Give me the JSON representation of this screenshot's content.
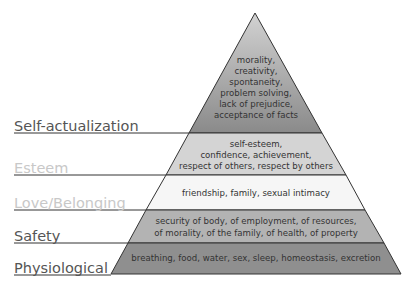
{
  "diagram": {
    "type": "pyramid",
    "colors": {
      "outline": "#333333",
      "label_dark": "#555555",
      "label_light": "#c8c8c8",
      "self_actualization_top": "#d2d2d2",
      "self_actualization_bottom": "#8a8a8a",
      "esteem": "#d4d4d4",
      "love_belonging": "#f6f6f6",
      "safety": "#b3b3b3",
      "physiological": "#8f8f8f"
    },
    "levels": [
      {
        "name": "Self-actualization",
        "lines": [
          "morality,",
          "creativity,",
          "spontaneity,",
          "problem solving,",
          "lack of prejudice,",
          "acceptance of facts"
        ]
      },
      {
        "name": "Esteem",
        "lines": [
          "self-esteem,",
          "confidence, achievement,",
          "respect of others, respect by others"
        ]
      },
      {
        "name": "Love/Belonging",
        "lines": [
          "friendship, family, sexual intimacy"
        ]
      },
      {
        "name": "Safety",
        "lines": [
          "security of body, of employment, of resources,",
          "of morality, of the family, of health, of property"
        ]
      },
      {
        "name": "Physiological",
        "lines": [
          "breathing, food, water, sex, sleep, homeostasis, excretion"
        ]
      }
    ]
  }
}
